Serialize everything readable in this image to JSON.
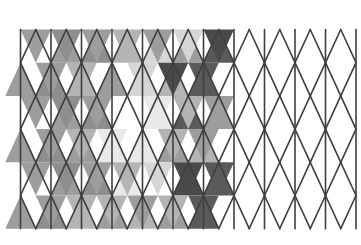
{
  "figure": {
    "type": "geometric-pattern",
    "canvas": {
      "width": 361,
      "height": 245,
      "background": "#ffffff"
    }
  },
  "geometry": {
    "origin_x": 20.5,
    "origin_y": 29.5,
    "column_step": 30.5,
    "row_height": 33.2,
    "columns": 11,
    "rows": 6,
    "stroke_color": "#3f3f3f",
    "stroke_width": 1.6,
    "shaded_column_limit": 5.5
  },
  "palette": {
    "white": "#ffffff",
    "very_light": "#e9e9e9",
    "light": "#d6d6d6",
    "mid_light": "#b4b4b4",
    "mid": "#9d9d9d",
    "mid_dark": "#8e8e8e",
    "dark": "#6f6f6f",
    "darker": "#5a5a5a",
    "darkest": "#4a4a4a",
    "outline": "#3f3f3f"
  },
  "chart_data": {
    "type": "heatmap",
    "xlabel": "column (half-step index)",
    "ylabel": "row",
    "grid": true,
    "legend": "none",
    "note": "Each row holds up-pointing and down-pointing triangles alternating along x. Values are the gray fill keys from palette; 'white' means unfilled.",
    "rows": [
      {
        "row": 0,
        "up": [
          "white",
          "mid",
          "mid_dark",
          "mid_light",
          "light",
          "mid",
          "darker",
          "darkest",
          "darker",
          "white",
          "white",
          "white",
          "white",
          "white",
          "white",
          "white",
          "white",
          "white",
          "white",
          "white",
          "white",
          "white"
        ],
        "down": [
          "mid",
          "mid_dark",
          "mid",
          "mid_light",
          "mid",
          "light",
          "darkest",
          "darker",
          "white",
          "white",
          "white",
          "white",
          "white",
          "white",
          "white",
          "white",
          "white",
          "white",
          "white",
          "white",
          "white",
          "white"
        ]
      },
      {
        "row": 1,
        "up": [
          "mid",
          "mid_dark",
          "mid_light",
          "mid",
          "light",
          "mid_light",
          "darker",
          "darkest",
          "darker",
          "white",
          "white",
          "white",
          "white",
          "white",
          "white",
          "white",
          "white",
          "white",
          "white",
          "white",
          "white",
          "white"
        ],
        "down": [
          "white",
          "mid",
          "mid_light",
          "white",
          "light",
          "darkest",
          "darker",
          "darkest",
          "white",
          "white",
          "white",
          "white",
          "white",
          "white",
          "white",
          "white",
          "white",
          "white",
          "white",
          "white",
          "white",
          "white"
        ]
      },
      {
        "row": 2,
        "up": [
          "white",
          "mid",
          "mid_dark",
          "white",
          "very_light",
          "darker",
          "mid",
          "darker",
          "white",
          "white",
          "white",
          "white",
          "white",
          "white",
          "white",
          "white",
          "white",
          "white",
          "white",
          "white",
          "white",
          "white"
        ],
        "down": [
          "mid",
          "mid_dark",
          "mid",
          "white",
          "very_light",
          "mid_light",
          "mid",
          "darker",
          "white",
          "white",
          "white",
          "white",
          "white",
          "white",
          "white",
          "white",
          "white",
          "white",
          "white",
          "white",
          "white",
          "white"
        ]
      },
      {
        "row": 3,
        "up": [
          "mid",
          "mid_dark",
          "mid",
          "very_light",
          "very_light",
          "mid",
          "mid_light",
          "darker",
          "white",
          "white",
          "white",
          "white",
          "white",
          "white",
          "white",
          "white",
          "white",
          "white",
          "white",
          "white",
          "white",
          "white"
        ],
        "down": [
          "white",
          "mid",
          "mid_light",
          "very_light",
          "white",
          "mid_light",
          "mid",
          "darker",
          "white",
          "white",
          "white",
          "white",
          "white",
          "white",
          "white",
          "white",
          "white",
          "white",
          "white",
          "white",
          "white",
          "white"
        ]
      },
      {
        "row": 4,
        "up": [
          "white",
          "mid",
          "mid_dark",
          "very_light",
          "white",
          "darkest",
          "darker",
          "darker",
          "white",
          "white",
          "white",
          "white",
          "white",
          "white",
          "white",
          "white",
          "white",
          "white",
          "white",
          "white",
          "white",
          "white"
        ],
        "down": [
          "mid",
          "mid_dark",
          "mid",
          "mid_light",
          "light",
          "darkest",
          "darker",
          "darkest",
          "white",
          "white",
          "white",
          "white",
          "white",
          "white",
          "white",
          "white",
          "white",
          "white",
          "white",
          "white",
          "white",
          "white"
        ]
      },
      {
        "row": 5,
        "up": [
          "mid",
          "mid_dark",
          "mid_light",
          "mid",
          "mid_light",
          "mid",
          "darker",
          "darkest",
          "darker",
          "white",
          "white",
          "white",
          "white",
          "white",
          "white",
          "white",
          "white",
          "white",
          "white",
          "white",
          "white",
          "white"
        ],
        "down": [
          "white",
          "mid",
          "mid_light",
          "mid_light",
          "mid",
          "mid_light",
          "darker",
          "darker",
          "white",
          "white",
          "white",
          "white",
          "white",
          "white",
          "white",
          "white",
          "white",
          "white",
          "white",
          "white",
          "white",
          "white"
        ]
      }
    ]
  }
}
